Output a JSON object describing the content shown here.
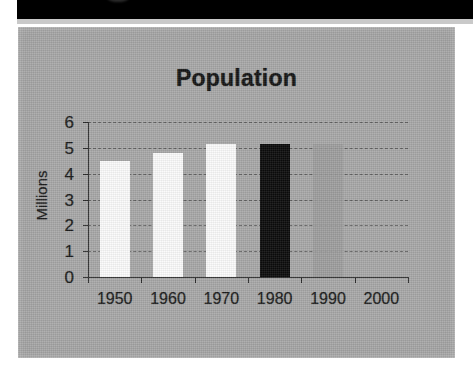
{
  "figure": {
    "panel_background": "#a8a8a8",
    "masthead_color": "#000000"
  },
  "chart_data": {
    "type": "bar",
    "title": "Population",
    "xlabel": "",
    "ylabel": "Millions",
    "categories": [
      "1950",
      "1960",
      "1970",
      "1980",
      "1990",
      "2000"
    ],
    "values": [
      4.5,
      4.8,
      5.15,
      5.15,
      5.15,
      null
    ],
    "series": [
      {
        "name": "Population",
        "values": [
          4.5,
          4.8,
          5.15,
          5.15,
          5.15,
          null
        ]
      }
    ],
    "bar_colors": [
      "#fbfbfb",
      "#fbfbfb",
      "#fbfbfb",
      "#0b0b0b",
      "#9d9d9d",
      "none"
    ],
    "ylim": [
      0,
      6
    ],
    "yticks": [
      0,
      1,
      2,
      3,
      4,
      5,
      6
    ],
    "ytick_labels": [
      "0",
      "1",
      "2",
      "3",
      "4",
      "5",
      "6"
    ],
    "grid": true,
    "grid_orientation": "horizontal",
    "legend": false,
    "legend_position": "none",
    "annotations": []
  }
}
